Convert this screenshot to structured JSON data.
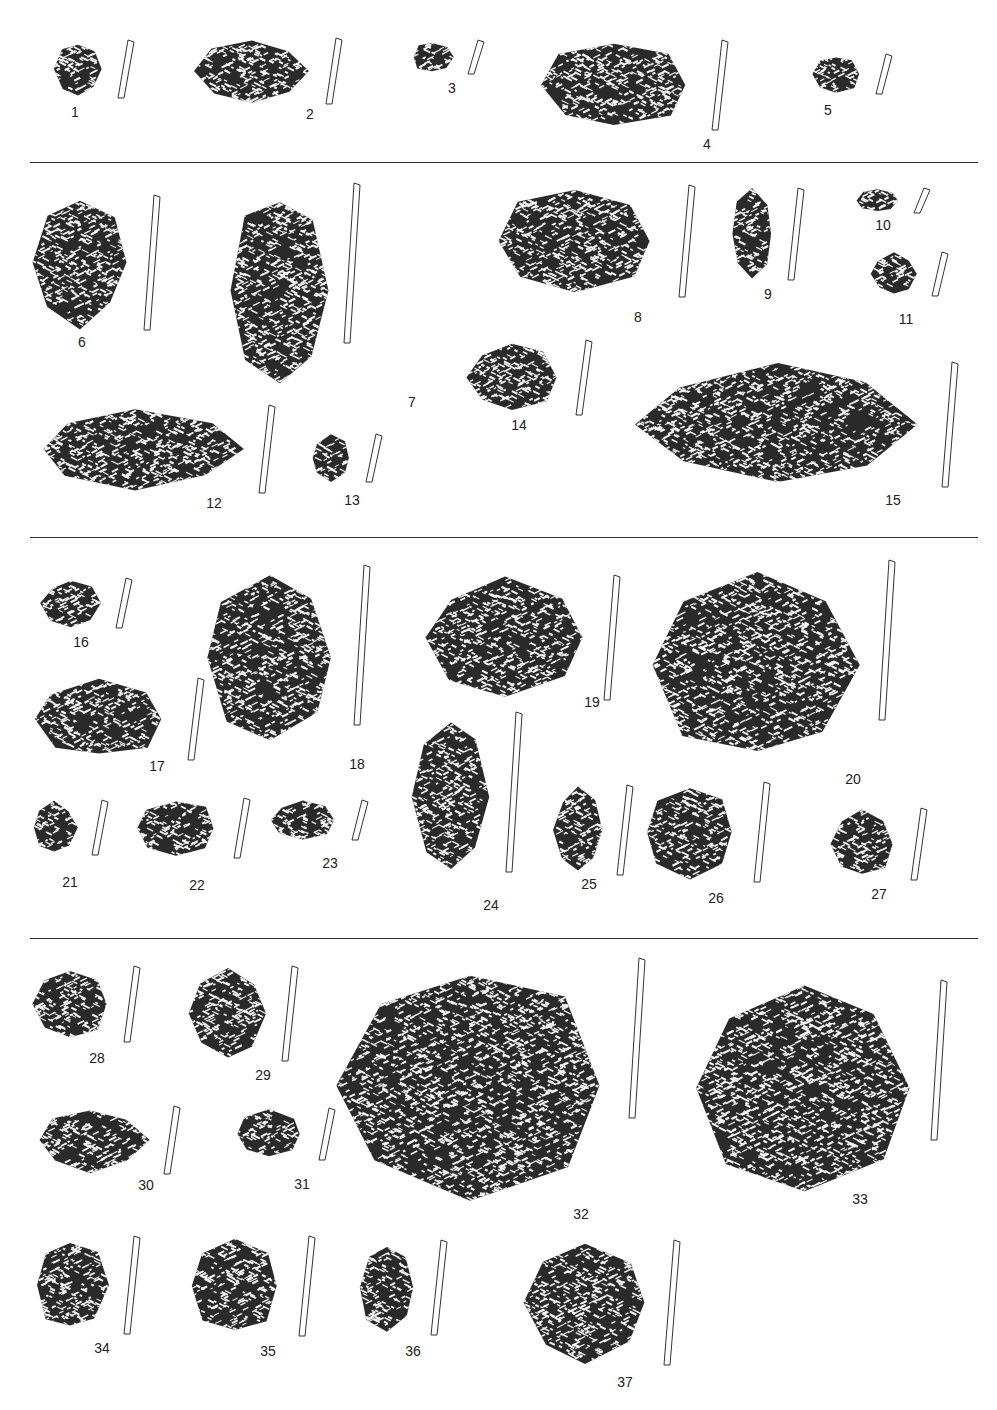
{
  "figure": {
    "type": "archaeological pottery sherd plate",
    "rows": 4,
    "separators_y": [
      162,
      537,
      938
    ]
  },
  "sherds": [
    {
      "id": "1",
      "x": 52,
      "y": 40,
      "w": 52,
      "h": 58,
      "lx": 75,
      "ly": 118
    },
    {
      "id": "2",
      "x": 192,
      "y": 38,
      "w": 120,
      "h": 66,
      "lx": 310,
      "ly": 120
    },
    {
      "id": "3",
      "x": 410,
      "y": 40,
      "w": 44,
      "h": 34,
      "lx": 452,
      "ly": 94
    },
    {
      "id": "4",
      "x": 530,
      "y": 40,
      "w": 168,
      "h": 90,
      "lx": 707,
      "ly": 150
    },
    {
      "id": "5",
      "x": 810,
      "y": 54,
      "w": 52,
      "h": 40,
      "lx": 828,
      "ly": 116
    },
    {
      "id": "6",
      "x": 30,
      "y": 195,
      "w": 100,
      "h": 135,
      "lx": 82,
      "ly": 348
    },
    {
      "id": "7",
      "x": 230,
      "y": 183,
      "w": 100,
      "h": 215,
      "lx": 412,
      "ly": 408
    },
    {
      "id": "8",
      "x": 485,
      "y": 185,
      "w": 180,
      "h": 112,
      "lx": 638,
      "ly": 323
    },
    {
      "id": "9",
      "x": 730,
      "y": 188,
      "w": 44,
      "h": 92,
      "lx": 768,
      "ly": 300
    },
    {
      "id": "10",
      "x": 855,
      "y": 188,
      "w": 45,
      "h": 25,
      "lx": 883,
      "ly": 231
    },
    {
      "id": "11",
      "x": 870,
      "y": 252,
      "w": 48,
      "h": 44,
      "lx": 906,
      "ly": 325
    },
    {
      "id": "12",
      "x": 25,
      "y": 405,
      "w": 220,
      "h": 88,
      "lx": 214,
      "ly": 509
    },
    {
      "id": "13",
      "x": 310,
      "y": 434,
      "w": 42,
      "h": 48,
      "lx": 352,
      "ly": 506
    },
    {
      "id": "14",
      "x": 462,
      "y": 340,
      "w": 100,
      "h": 75,
      "lx": 519,
      "ly": 431
    },
    {
      "id": "15",
      "x": 628,
      "y": 362,
      "w": 300,
      "h": 125,
      "lx": 893,
      "ly": 506
    },
    {
      "id": "16",
      "x": 40,
      "y": 578,
      "w": 62,
      "h": 50,
      "lx": 81,
      "ly": 648
    },
    {
      "id": "17",
      "x": 24,
      "y": 678,
      "w": 150,
      "h": 82,
      "lx": 157,
      "ly": 772
    },
    {
      "id": "18",
      "x": 200,
      "y": 565,
      "w": 140,
      "h": 185,
      "lx": 357,
      "ly": 770
    },
    {
      "id": "19",
      "x": 420,
      "y": 575,
      "w": 170,
      "h": 125,
      "lx": 592,
      "ly": 708
    },
    {
      "id": "20",
      "x": 650,
      "y": 560,
      "w": 215,
      "h": 210,
      "lx": 853,
      "ly": 785
    },
    {
      "id": "21",
      "x": 30,
      "y": 800,
      "w": 48,
      "h": 55,
      "lx": 70,
      "ly": 888
    },
    {
      "id": "22",
      "x": 132,
      "y": 798,
      "w": 88,
      "h": 60,
      "lx": 197,
      "ly": 891
    },
    {
      "id": "23",
      "x": 268,
      "y": 800,
      "w": 70,
      "h": 40,
      "lx": 330,
      "ly": 869
    },
    {
      "id": "24",
      "x": 410,
      "y": 712,
      "w": 82,
      "h": 170,
      "lx": 491,
      "ly": 911
    },
    {
      "id": "25",
      "x": 553,
      "y": 785,
      "w": 50,
      "h": 90,
      "lx": 589,
      "ly": 890
    },
    {
      "id": "26",
      "x": 640,
      "y": 782,
      "w": 100,
      "h": 100,
      "lx": 716,
      "ly": 904
    },
    {
      "id": "27",
      "x": 827,
      "y": 808,
      "w": 70,
      "h": 72,
      "lx": 879,
      "ly": 900
    },
    {
      "id": "28",
      "x": 30,
      "y": 966,
      "w": 80,
      "h": 76,
      "lx": 97,
      "ly": 1064
    },
    {
      "id": "29",
      "x": 188,
      "y": 966,
      "w": 80,
      "h": 95,
      "lx": 263,
      "ly": 1081
    },
    {
      "id": "30",
      "x": 30,
      "y": 1106,
      "w": 120,
      "h": 68,
      "lx": 146,
      "ly": 1191
    },
    {
      "id": "31",
      "x": 233,
      "y": 1108,
      "w": 72,
      "h": 52,
      "lx": 302,
      "ly": 1190
    },
    {
      "id": "32",
      "x": 325,
      "y": 958,
      "w": 290,
      "h": 255,
      "lx": 581,
      "ly": 1220
    },
    {
      "id": "33",
      "x": 692,
      "y": 980,
      "w": 225,
      "h": 216,
      "lx": 860,
      "ly": 1205
    },
    {
      "id": "34",
      "x": 30,
      "y": 1236,
      "w": 80,
      "h": 98,
      "lx": 102,
      "ly": 1354
    },
    {
      "id": "35",
      "x": 185,
      "y": 1236,
      "w": 100,
      "h": 100,
      "lx": 268,
      "ly": 1357
    },
    {
      "id": "36",
      "x": 357,
      "y": 1240,
      "w": 60,
      "h": 95,
      "lx": 413,
      "ly": 1357
    },
    {
      "id": "37",
      "x": 520,
      "y": 1240,
      "w": 130,
      "h": 125,
      "lx": 625,
      "ly": 1388
    }
  ],
  "caption": {
    "text": "",
    "legible": false
  }
}
